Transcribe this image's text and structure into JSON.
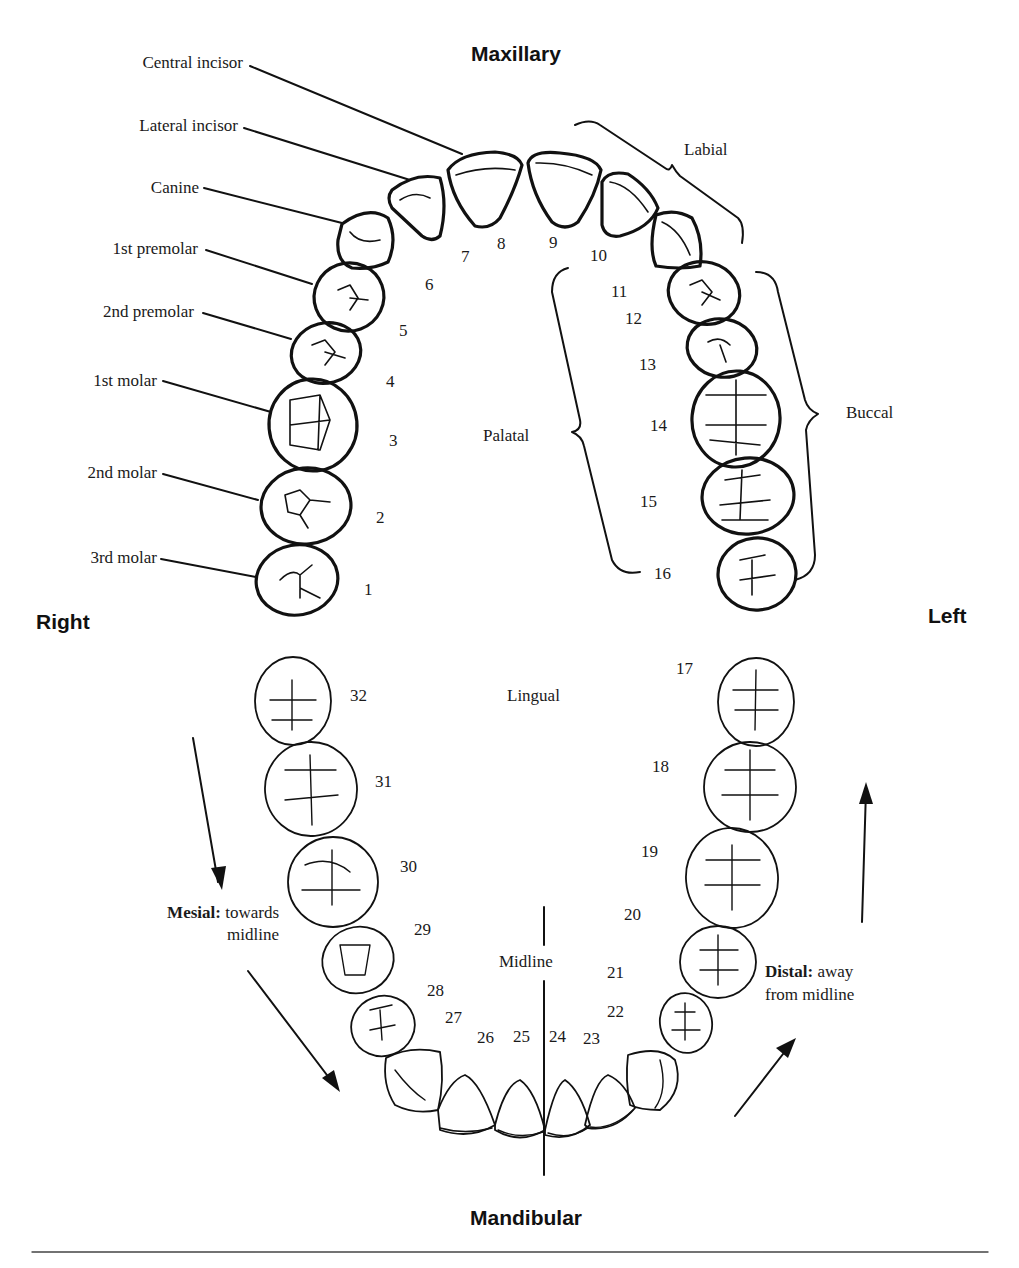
{
  "headings": {
    "top": "Maxillary",
    "bottom": "Mandibular",
    "right_side": "Right",
    "left_side": "Left"
  },
  "tooth_types": [
    {
      "label": "Central incisor",
      "tooth": 8
    },
    {
      "label": "Lateral incisor",
      "tooth": 7
    },
    {
      "label": "Canine",
      "tooth": 6
    },
    {
      "label": "1st premolar",
      "tooth": 5
    },
    {
      "label": "2nd premolar",
      "tooth": 4
    },
    {
      "label": "1st molar",
      "tooth": 3
    },
    {
      "label": "2nd molar",
      "tooth": 2
    },
    {
      "label": "3rd molar",
      "tooth": 1
    }
  ],
  "surfaces": {
    "labial": "Labial",
    "palatal": "Palatal",
    "buccal": "Buccal",
    "lingual": "Lingual",
    "midline": "Midline"
  },
  "directions": {
    "mesial_term": "Mesial:",
    "mesial_line1": "towards",
    "mesial_line2": "midline",
    "distal_term": "Distal:",
    "distal_line1": "away",
    "distal_line2": "from midline"
  },
  "tooth_numbers": {
    "maxillary": [
      "1",
      "2",
      "3",
      "4",
      "5",
      "6",
      "7",
      "8",
      "9",
      "10",
      "11",
      "12",
      "13",
      "14",
      "15",
      "16"
    ],
    "mandibular": [
      "17",
      "18",
      "19",
      "20",
      "21",
      "22",
      "23",
      "24",
      "25",
      "26",
      "27",
      "28",
      "29",
      "30",
      "31",
      "32"
    ]
  },
  "colors": {
    "ink": "#111111",
    "background": "#ffffff"
  }
}
